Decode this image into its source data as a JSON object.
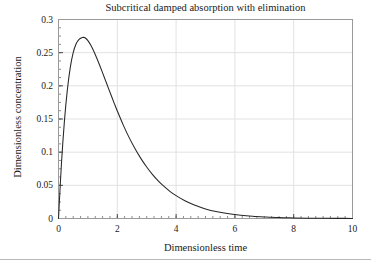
{
  "figure": {
    "background_color": "#ffffff",
    "frame_color": "#9a9a9a",
    "grid_color": "#e2e2e2",
    "curve_color": "#262626",
    "text_color": "#1a1a1a"
  },
  "chart_data": {
    "type": "line",
    "title": "Subcritical damped absorption with elimination",
    "xlabel": "Dimensionless time",
    "ylabel": "Dimensionless concentration",
    "xlim": [
      0,
      10
    ],
    "ylim": [
      0,
      0.3
    ],
    "grid": true,
    "legend": null,
    "xticks": [
      0,
      2,
      4,
      6,
      8,
      10
    ],
    "xtick_labels": [
      "0",
      "2",
      "4",
      "6",
      "8",
      "10"
    ],
    "yticks": [
      0,
      0.05,
      0.1,
      0.15,
      0.2,
      0.25,
      0.3
    ],
    "ytick_labels": [
      "0",
      "0.05",
      "0.1",
      "0.15",
      "0.2",
      "0.25",
      "0.3"
    ],
    "xtick_minor_step": 0.25,
    "ytick_minor_step": 0.0125,
    "series": [
      {
        "name": "concentration",
        "annotation": "peak 0.273 at t = 0.85",
        "x": [
          0,
          0.1,
          0.2,
          0.3,
          0.4,
          0.5,
          0.6,
          0.7,
          0.8,
          0.85,
          0.9,
          1.0,
          1.1,
          1.2,
          1.3,
          1.4,
          1.5,
          1.6,
          1.7,
          1.8,
          1.9,
          2.0,
          2.2,
          2.4,
          2.6,
          2.8,
          3.0,
          3.2,
          3.4,
          3.6,
          3.8,
          4.0,
          4.3,
          4.6,
          5.0,
          5.4,
          5.8,
          6.2,
          6.6,
          7.0,
          7.5,
          8.0,
          8.5,
          9.0,
          9.5,
          10.0
        ],
        "y": [
          0,
          0.0825,
          0.1461,
          0.1936,
          0.2274,
          0.25,
          0.2634,
          0.27,
          0.2727,
          0.273,
          0.2725,
          0.2682,
          0.2612,
          0.2522,
          0.242,
          0.2311,
          0.2196,
          0.2079,
          0.1962,
          0.1846,
          0.1732,
          0.1621,
          0.1412,
          0.1223,
          0.1055,
          0.0906,
          0.0776,
          0.0662,
          0.0564,
          0.0479,
          0.0406,
          0.0344,
          0.0267,
          0.0207,
          0.0145,
          0.0102,
          0.0071,
          0.0049,
          0.0034,
          0.0024,
          0.0014,
          0.0009,
          0.0005,
          0.0003,
          0.0002,
          0.0001
        ]
      }
    ]
  }
}
